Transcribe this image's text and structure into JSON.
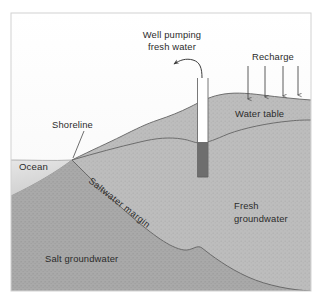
{
  "figure": {
    "colors": {
      "frame": "#d8d8d8",
      "sky_top": "#fdfdfd",
      "sky_bottom": "#eeeeee",
      "ocean": "#d5d5d5",
      "aquifer_fresh": "#b9b9b9",
      "aquifer_salt": "#a7a7a7",
      "well_casing": "#ffffff",
      "well_screen": "#6e6e6e",
      "outline": "#6a6a6a",
      "text": "#2b2b2b"
    }
  },
  "labels": {
    "well_pumping_line1": "Well pumping",
    "well_pumping_line2": "fresh water",
    "recharge": "Recharge",
    "water_table": "Water table",
    "shoreline": "Shoreline",
    "ocean": "Ocean",
    "saltwater_margin": "Saltwater margin",
    "fresh_groundwater_line1": "Fresh",
    "fresh_groundwater_line2": "groundwater",
    "salt_groundwater": "Salt groundwater"
  },
  "recharge_arrows": {
    "count": 4,
    "x_positions": [
      248,
      265,
      283,
      298
    ],
    "top_y": 66,
    "bottom_y": [
      100,
      98,
      96,
      95
    ]
  },
  "well": {
    "casing_left": 197,
    "casing_right": 208,
    "top_y": 78,
    "screen_top_y": 142,
    "bottom_y": 177,
    "pump_arrow": "curved-arrow-up-left"
  }
}
